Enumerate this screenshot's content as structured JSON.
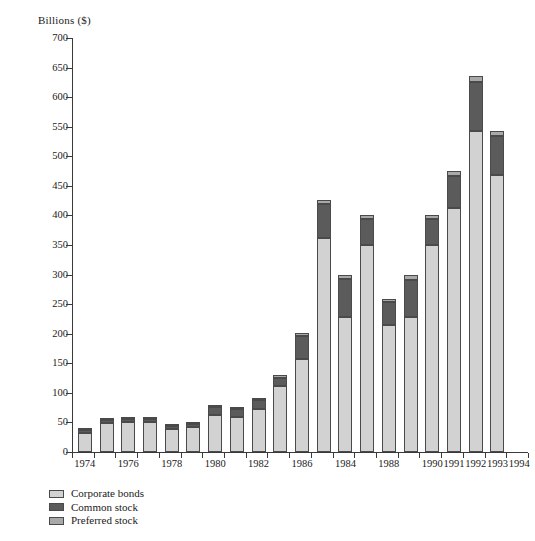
{
  "chart_data": {
    "type": "bar",
    "stacked": true,
    "title": "",
    "ylabel": "Billions ($)",
    "xlabel": "",
    "ylim": [
      0,
      700
    ],
    "ytick_step": 50,
    "grid": false,
    "legend_position": "below-left",
    "yticks": [
      0,
      50,
      100,
      150,
      200,
      250,
      300,
      350,
      400,
      450,
      500,
      550,
      600,
      650,
      700
    ],
    "categories": [
      "1974",
      "1975",
      "1976",
      "1977",
      "1978",
      "1979",
      "1980",
      "1981",
      "1982",
      "1983",
      "1984",
      "1985",
      "1986",
      "1987",
      "1988",
      "1989",
      "1990",
      "1991",
      "1992",
      "1993",
      "1994"
    ],
    "xtick_labels": [
      "1974",
      "",
      "1976",
      "",
      "1978",
      "",
      "1980",
      "",
      "1982",
      "",
      "1986",
      "",
      "1984",
      "",
      "1988",
      "",
      "1990",
      "1991",
      "1992",
      "1993",
      "1994"
    ],
    "series": [
      {
        "name": "Corporate bonds",
        "color": "#d2d2d2",
        "values": [
          32,
          49,
          51,
          51,
          39,
          42,
          63,
          60,
          72,
          111,
          158,
          362,
          229,
          350,
          214,
          229,
          350,
          412,
          542,
          468,
          0
        ]
      },
      {
        "name": "Common stock",
        "color": "#5b5b5b",
        "values": [
          5,
          5,
          5,
          5,
          5,
          5,
          13,
          12,
          16,
          14,
          38,
          58,
          63,
          44,
          40,
          62,
          44,
          55,
          83,
          66,
          0
        ]
      },
      {
        "name": "Preferred stock",
        "color": "#a9a9a9",
        "values": [
          2,
          2,
          2,
          2,
          2,
          2,
          3,
          3,
          3,
          6,
          5,
          6,
          8,
          6,
          5,
          9,
          6,
          8,
          10,
          9,
          0
        ]
      }
    ],
    "totals": [
      39,
      56,
      58,
      58,
      46,
      49,
      79,
      75,
      91,
      131,
      201,
      426,
      300,
      400,
      259,
      300,
      400,
      475,
      635,
      543,
      0
    ],
    "bars": [
      {
        "label": "1974",
        "bonds": 32,
        "common": 5,
        "preferred": 2,
        "total": 39
      },
      {
        "label": "1975",
        "bonds": 49,
        "common": 5,
        "preferred": 2,
        "total": 56
      },
      {
        "label": "1976",
        "bonds": 51,
        "common": 5,
        "preferred": 2,
        "total": 58
      },
      {
        "label": "1977",
        "bonds": 51,
        "common": 5,
        "preferred": 2,
        "total": 58
      },
      {
        "label": "1978",
        "bonds": 39,
        "common": 5,
        "preferred": 2,
        "total": 46
      },
      {
        "label": "1979",
        "bonds": 42,
        "common": 5,
        "preferred": 2,
        "total": 49
      },
      {
        "label": "1980",
        "bonds": 63,
        "common": 13,
        "preferred": 3,
        "total": 79
      },
      {
        "label": "1981",
        "bonds": 60,
        "common": 12,
        "preferred": 3,
        "total": 75
      },
      {
        "label": "1982",
        "bonds": 72,
        "common": 16,
        "preferred": 3,
        "total": 91
      },
      {
        "label": "1983",
        "bonds": 111,
        "common": 14,
        "preferred": 6,
        "total": 131
      },
      {
        "label": "1984",
        "bonds": 158,
        "common": 38,
        "preferred": 5,
        "total": 201
      },
      {
        "label": "1985",
        "bonds": 362,
        "common": 58,
        "preferred": 6,
        "total": 426
      },
      {
        "label": "1986",
        "bonds": 229,
        "common": 63,
        "preferred": 8,
        "total": 300
      },
      {
        "label": "1987",
        "bonds": 350,
        "common": 44,
        "preferred": 6,
        "total": 400
      },
      {
        "label": "1988",
        "bonds": 214,
        "common": 40,
        "preferred": 5,
        "total": 259
      },
      {
        "label": "1989",
        "bonds": 229,
        "common": 62,
        "preferred": 9,
        "total": 300
      },
      {
        "label": "1990",
        "bonds": 350,
        "common": 44,
        "preferred": 6,
        "total": 400
      },
      {
        "label": "1991",
        "bonds": 412,
        "common": 55,
        "preferred": 8,
        "total": 475
      },
      {
        "label": "1992",
        "bonds": 542,
        "common": 83,
        "preferred": 10,
        "total": 635
      },
      {
        "label": "1993",
        "bonds": 468,
        "common": 66,
        "preferred": 9,
        "total": 543
      }
    ],
    "legend": [
      {
        "label": "Corporate bonds",
        "color": "#d2d2d2"
      },
      {
        "label": "Common stock",
        "color": "#5b5b5b"
      },
      {
        "label": "Preferred stock",
        "color": "#a9a9a9"
      }
    ]
  }
}
